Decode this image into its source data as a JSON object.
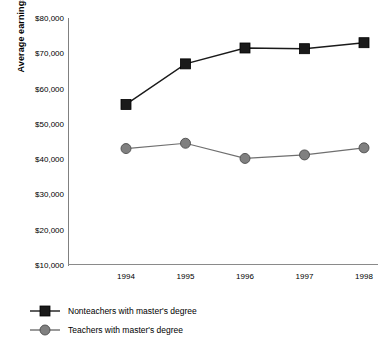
{
  "chart_data": {
    "type": "line",
    "title": "",
    "xlabel": "",
    "ylabel": "Average earnings",
    "categories": [
      "1994",
      "1995",
      "1996",
      "1997",
      "1998"
    ],
    "x": [
      1994,
      1995,
      1996,
      1997,
      1998
    ],
    "ylim": [
      10000,
      80000
    ],
    "ytick_labels": [
      "$80,000",
      "$70,000",
      "$60,000",
      "$50,000",
      "$40,000",
      "$30,000",
      "$20,000",
      "$10,000"
    ],
    "ytick_values": [
      80000,
      70000,
      60000,
      50000,
      40000,
      30000,
      20000,
      10000
    ],
    "grid": false,
    "legend_position": "below",
    "series": [
      {
        "name": "Nonteachers with master's degree",
        "marker": "square",
        "color": "#1a1a1a",
        "values": [
          55500,
          67000,
          71500,
          71300,
          73000
        ]
      },
      {
        "name": "Teachers with master's degree",
        "marker": "circle",
        "color": "#808080",
        "values": [
          43000,
          44500,
          40200,
          41200,
          43200
        ]
      }
    ]
  },
  "legend": {
    "items": [
      {
        "label": "Nonteachers with master's degree",
        "marker": "square",
        "color": "#1a1a1a"
      },
      {
        "label": "Teachers with master's degree",
        "marker": "circle",
        "color": "#808080"
      }
    ]
  }
}
